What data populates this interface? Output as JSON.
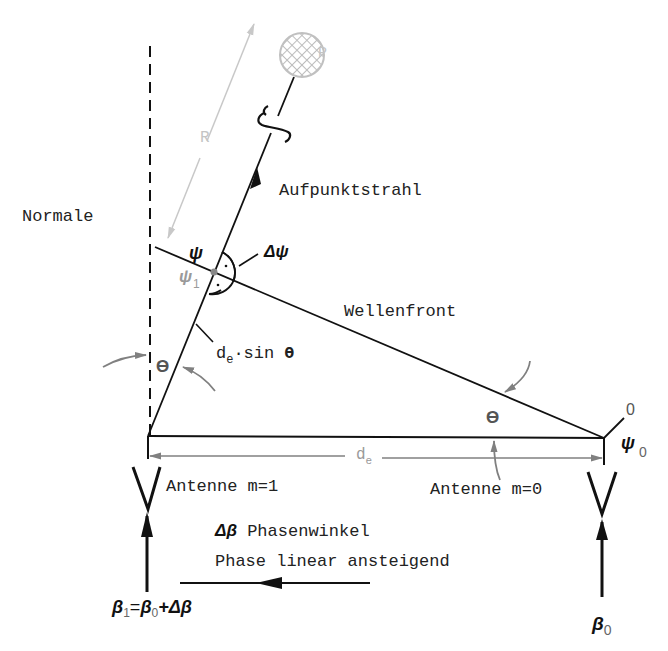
{
  "diagram": {
    "colors": {
      "line": "#111111",
      "gray_arrow": "#7a7a7a",
      "light": "#c8c8c8",
      "text": "#222222"
    },
    "labels": {
      "normal": "Normale",
      "ray": "Aufpunktstrahl",
      "wavefront": "Wellenfront",
      "point": "P",
      "distance_R": "R",
      "psi": "ψ",
      "psi1": "ψ",
      "psi1_sub": "1",
      "delta_psi": "Δψ",
      "path_diff_prefix": "d",
      "path_diff_sub": "e",
      "path_diff_suffix": "·sin ",
      "theta": "ϴ",
      "theta_left": "ϴ",
      "theta_right": "ϴ",
      "spacing_prefix": "d",
      "spacing_sub": "e",
      "antenna_1": "Antenne m=1",
      "antenna_0": "Antenne m=0",
      "zero_label": "0",
      "psi0": "ψ",
      "psi0_sub": "0",
      "delta_beta": "Δβ",
      "phase_angle": " Phasenwinkel",
      "phase_linear": "Phase linear ansteigend",
      "beta1_lhs": "β",
      "beta1_lhs_sub": "1",
      "beta1_eq": "=",
      "beta1_b0": "β",
      "beta1_b0_sub": "0",
      "beta1_plus": "+Δβ",
      "beta0": "β",
      "beta0_sub": "0"
    }
  }
}
